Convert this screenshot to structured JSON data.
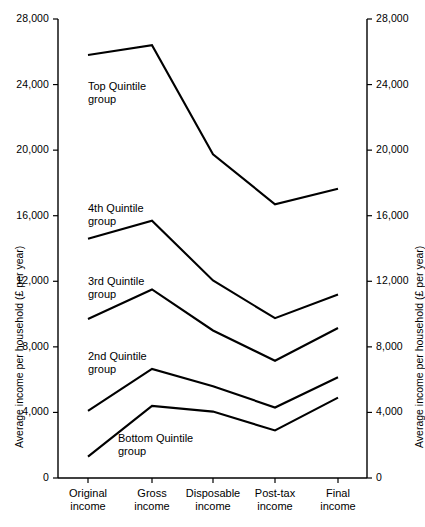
{
  "chart_data": {
    "type": "line",
    "title": "",
    "xlabel": "",
    "ylabel": "Average income per household (£ per year)",
    "ylabel_right": "Average income per household (£ per year)",
    "categories": [
      "Original\nincome",
      "Gross\nincome",
      "Disposable\nincome",
      "Post-tax\nincome",
      "Final\nincome"
    ],
    "ylim": [
      0,
      28000
    ],
    "yticks": [
      0,
      4000,
      8000,
      12000,
      16000,
      20000,
      24000,
      28000
    ],
    "ytick_labels": [
      "0",
      "4,000",
      "8,000",
      "12,000",
      "16,000",
      "20,000",
      "24,000",
      "28,000"
    ],
    "grid": false,
    "legend_position": "inline-annotations",
    "series": [
      {
        "name": "Top Quintile\ngroup",
        "values": [
          25800,
          26400,
          19750,
          16700,
          17650
        ]
      },
      {
        "name": "4th Quintile\ngroup",
        "values": [
          14600,
          15700,
          12050,
          9750,
          11200
        ]
      },
      {
        "name": "3rd Quintile\ngroup",
        "values": [
          9700,
          11500,
          9000,
          7150,
          9150
        ]
      },
      {
        "name": "2nd Quintile\ngroup",
        "values": [
          4100,
          6650,
          5600,
          4300,
          6150
        ]
      },
      {
        "name": "Bottom Quintile\ngroup",
        "values": [
          1300,
          4400,
          4050,
          2900,
          4900
        ]
      }
    ],
    "annotations": [
      {
        "text": "Top Quintile\ngroup",
        "x": 88,
        "y": 80
      },
      {
        "text": "4th Quintile\ngroup",
        "x": 88,
        "y": 202
      },
      {
        "text": "3rd Quintile\ngroup",
        "x": 88,
        "y": 275
      },
      {
        "text": "2nd Quintile\ngroup",
        "x": 88,
        "y": 350
      },
      {
        "text": "Bottom Quintile\ngroup",
        "x": 118,
        "y": 432
      }
    ],
    "colors": {
      "line": "#000000",
      "axis": "#000000",
      "background": "#ffffff"
    }
  }
}
